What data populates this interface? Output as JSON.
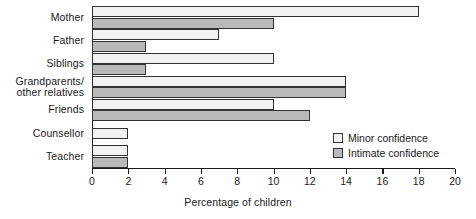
{
  "chart_data": {
    "type": "bar",
    "orientation": "horizontal",
    "title": "",
    "xlabel": "Percentage of children",
    "ylabel": "",
    "xlim": [
      0,
      20
    ],
    "xticks": [
      0,
      2,
      4,
      6,
      8,
      10,
      12,
      14,
      16,
      18,
      20
    ],
    "xtick_labels": [
      "0",
      "2",
      "4",
      "6",
      "8",
      "10",
      "12",
      "14",
      "16",
      "18",
      "20"
    ],
    "grid": false,
    "categories": [
      "Mother",
      "Father",
      "Siblings",
      "Grandparents/\nother relatives",
      "Friends",
      "Counsellor",
      "Teacher"
    ],
    "series": [
      {
        "name": "Minor confidence",
        "color": "#f2f2f2",
        "values": [
          18,
          7,
          10,
          14,
          10,
          2,
          2
        ]
      },
      {
        "name": "Intimate confidence",
        "color": "#b9b9b9",
        "values": [
          10,
          3,
          3,
          14,
          12,
          0,
          2
        ]
      }
    ],
    "legend": {
      "position": "inside-bottom-right",
      "entries": [
        {
          "label": "Minor confidence",
          "swatch": "minor"
        },
        {
          "label": "Intimate confidence",
          "swatch": "intimate"
        }
      ]
    }
  }
}
